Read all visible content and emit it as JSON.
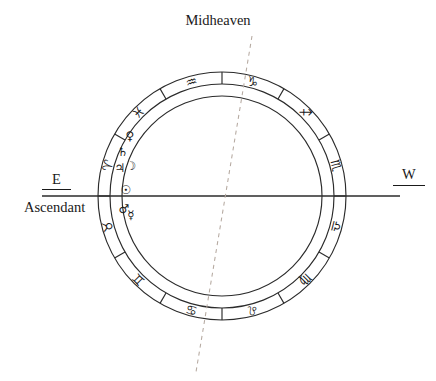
{
  "chart_data": {
    "type": "other",
    "chart_kind": "astrological-natal-wheel",
    "title": "",
    "center": {
      "x": 222,
      "y": 196
    },
    "radii": {
      "outer": 124,
      "middle": 112,
      "inner": 100
    },
    "axes": [
      {
        "name": "ascendant-descendant-axis",
        "style": "solid",
        "label_left": "E",
        "label_right": "W",
        "x1": 42,
        "y1": 196,
        "x2": 400,
        "y2": 196
      },
      {
        "name": "midheaven-ic-axis",
        "style": "dashed",
        "label_top": "Midheaven",
        "x1": 252,
        "y1": 36,
        "x2": 196,
        "y2": 372
      }
    ],
    "zodiac_signs": [
      {
        "name": "Aquarius",
        "glyph": "♒",
        "angle_deg": 105,
        "sector_index": 0
      },
      {
        "name": "Capricorn",
        "glyph": "♑",
        "angle_deg": 75,
        "sector_index": 1
      },
      {
        "name": "Sagittarius",
        "glyph": "♐",
        "angle_deg": 45,
        "sector_index": 2
      },
      {
        "name": "Scorpio",
        "glyph": "♏",
        "angle_deg": 15,
        "sector_index": 3
      },
      {
        "name": "Libra",
        "glyph": "♎",
        "angle_deg": 345,
        "sector_index": 4
      },
      {
        "name": "Virgo",
        "glyph": "♍",
        "angle_deg": 315,
        "sector_index": 5
      },
      {
        "name": "Leo",
        "glyph": "♌",
        "angle_deg": 285,
        "sector_index": 6
      },
      {
        "name": "Cancer",
        "glyph": "♋",
        "angle_deg": 255,
        "sector_index": 7
      },
      {
        "name": "Gemini",
        "glyph": "♊",
        "angle_deg": 225,
        "sector_index": 8
      },
      {
        "name": "Taurus",
        "glyph": "♉",
        "angle_deg": 195,
        "sector_index": 9
      },
      {
        "name": "Aries",
        "glyph": "♈",
        "angle_deg": 165,
        "sector_index": 10
      },
      {
        "name": "Pisces",
        "glyph": "♓",
        "angle_deg": 135,
        "sector_index": 11
      }
    ],
    "planets": [
      {
        "name": "Venus",
        "glyph": "♀",
        "x": 130,
        "y": 136
      },
      {
        "name": "Saturn",
        "glyph": "♄",
        "x": 123,
        "y": 152
      },
      {
        "name": "Jupiter",
        "glyph": "♃",
        "x": 120,
        "y": 168
      },
      {
        "name": "Moon",
        "glyph": "☽",
        "x": 131,
        "y": 166
      },
      {
        "name": "Sun",
        "glyph": "☉",
        "x": 126,
        "y": 190
      },
      {
        "name": "Mars",
        "glyph": "♂",
        "x": 124,
        "y": 209
      },
      {
        "name": "Mercury",
        "glyph": "☿",
        "x": 131,
        "y": 215
      }
    ],
    "sector_divider_count": 12,
    "grid": false,
    "legend": "none"
  },
  "labels": {
    "midheaven": "Midheaven",
    "east": "E",
    "ascendant": "Ascendant",
    "west": "W"
  },
  "colors": {
    "stroke": "#2b2b2b",
    "dashed_stroke": "#b5a9a0",
    "text": "#1a1a1a",
    "background": "#ffffff"
  }
}
